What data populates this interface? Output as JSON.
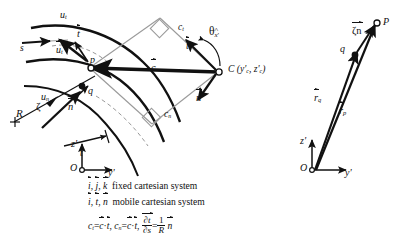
{
  "figure": {
    "background_color": "#ffffff",
    "ink_color": "#111111"
  },
  "left_diagram": {
    "name": "streamline-mobile-frame",
    "labels": {
      "u_t_upper": "u",
      "u_t_upper_sub": "t",
      "u_t_inner": "u",
      "u_t_inner_sub": "t",
      "u_n": "u",
      "u_n_sub": "n",
      "s": "s",
      "t_unit": "t",
      "n_unit": "n",
      "c_vector": "c",
      "t_tangent_label": "t",
      "n_normal_label": "n",
      "c_t": "c",
      "c_t_sub": "t",
      "c_n": "c",
      "c_n_sub": "n",
      "theta": "θ",
      "theta_sub": "x",
      "theta_sub_prime": "'",
      "center_point": "C",
      "center_coords": "(y'  , z'  )",
      "center_coords_full": "C (y'c , z'c)",
      "coord_sub_c1": "c",
      "coord_sub_c2": "c",
      "point_p": "p",
      "point_q": "q",
      "zeta": "ζ",
      "radius_R": "R",
      "t_distance": "t",
      "axis_z": "z",
      "axis_z_prime": "'",
      "axis_y": "y",
      "axis_y_prime": "'",
      "origin": "O"
    }
  },
  "right_diagram": {
    "name": "position-vector-diagram",
    "labels": {
      "point_P": "P",
      "point_q": "q",
      "zeta_n": "ζn",
      "r_q": "r",
      "r_q_sub": "q",
      "r_p": "r",
      "r_p_sub": "p",
      "axis_z": "z",
      "axis_z_prime": "'",
      "axis_y": "y",
      "axis_y_prime": "'",
      "origin": "O"
    }
  },
  "caption": {
    "line1": {
      "vec1": "i",
      "sep1": ",",
      "vec2": "j",
      "sep2": ",",
      "vec3": "k",
      "text": "fixed cartesian system"
    },
    "line2": {
      "vec1": "i",
      "sep1": ",",
      "vec2": "t",
      "sep2": ",",
      "vec3": "n",
      "text": "mobile cartesian system"
    },
    "line3": {
      "ct": "c",
      "ct_sub": "t",
      "eq1": "=",
      "c1": "c",
      "dot1": "·",
      "t1": "t",
      "comma1": ",",
      "cn": "c",
      "cn_sub": "n",
      "eq2": "=",
      "c2": "c",
      "dot2": "·",
      "t2": "t",
      "comma2": ",",
      "deriv_num": "∂t",
      "deriv_den": "∂s",
      "eq3": "=",
      "frac_num": "1",
      "frac_den": "R",
      "n_unit": "n"
    }
  }
}
